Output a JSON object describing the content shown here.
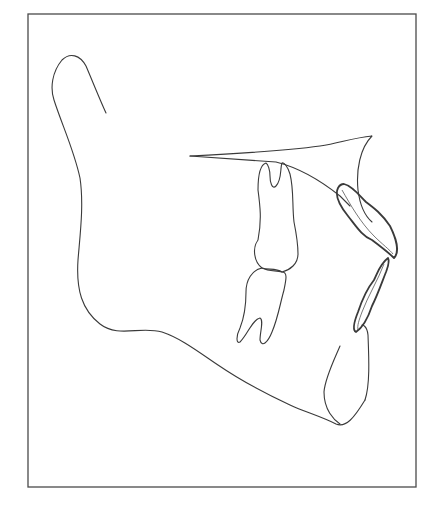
{
  "figure": {
    "title": "",
    "stroke_color": "#3a3a3a",
    "background_color": "#ffffff",
    "structures": [
      {
        "id": "frame",
        "label": ""
      },
      {
        "id": "mandible",
        "label": ""
      },
      {
        "id": "condyle-ramus",
        "label": ""
      },
      {
        "id": "palatal-plane",
        "label": ""
      },
      {
        "id": "maxillary-molar",
        "label": ""
      },
      {
        "id": "mandibular-molar",
        "label": ""
      },
      {
        "id": "maxillary-incisor",
        "label": ""
      },
      {
        "id": "mandibular-incisor",
        "label": ""
      },
      {
        "id": "symphysis",
        "label": ""
      }
    ]
  }
}
